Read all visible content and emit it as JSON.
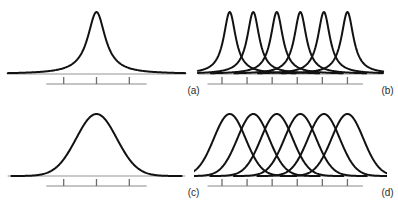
{
  "figure": {
    "background_color": "#ffffff",
    "curve_color": "#121212",
    "baseline_color": "#b9b9b9",
    "scalebar_color": "#b0b0b0",
    "tick_color": "#6d6d6d",
    "label_color": "#2b2b2b",
    "layout": "2x2 grid of line plots"
  },
  "chart_data": [
    {
      "type": "line",
      "panel": "a",
      "label": "(a)",
      "title": "",
      "xlabel": "",
      "ylabel": "",
      "description": "Single narrow Lorentzian peak on a flat baseline",
      "peak_shape": "lorentzian",
      "peak_count": 1,
      "peak_centers": [
        0.5
      ],
      "peak_heights": [
        1.0
      ],
      "peak_width": 0.055,
      "tick_count": 3,
      "tick_positions": [
        0.33,
        0.5,
        0.67
      ],
      "scalebar_range": [
        0.24,
        0.76
      ],
      "baseline_range": [
        0.04,
        0.96
      ],
      "xlim": [
        0,
        1
      ],
      "ylim": [
        0,
        1.1
      ],
      "grid": false,
      "legend": false
    },
    {
      "type": "line",
      "panel": "b",
      "label": "(b)",
      "title": "",
      "xlabel": "",
      "ylabel": "",
      "description": "Six narrow Lorentzian peaks, evenly spaced, resolved",
      "peak_shape": "lorentzian",
      "peak_count": 6,
      "peak_centers": [
        0.185,
        0.307,
        0.429,
        0.551,
        0.673,
        0.795
      ],
      "peak_heights": [
        1.0,
        1.0,
        1.0,
        1.0,
        1.0,
        1.0
      ],
      "peak_width": 0.038,
      "tick_count": 6,
      "tick_positions": [
        0.145,
        0.275,
        0.405,
        0.535,
        0.665,
        0.795
      ],
      "scalebar_range": [
        0.07,
        0.875
      ],
      "baseline_range": [
        0.02,
        0.98
      ],
      "xlim": [
        0,
        1
      ],
      "ylim": [
        0,
        1.1
      ],
      "grid": false,
      "legend": false
    },
    {
      "type": "line",
      "panel": "c",
      "label": "(c)",
      "title": "",
      "xlabel": "",
      "ylabel": "",
      "description": "Single broad Gaussian peak on a flat baseline",
      "peak_shape": "gaussian",
      "peak_count": 1,
      "peak_centers": [
        0.5
      ],
      "peak_heights": [
        1.0
      ],
      "peak_width": 0.105,
      "tick_count": 3,
      "tick_positions": [
        0.33,
        0.5,
        0.67
      ],
      "scalebar_range": [
        0.24,
        0.76
      ],
      "baseline_range": [
        0.04,
        0.96
      ],
      "xlim": [
        0,
        1
      ],
      "ylim": [
        0,
        1.1
      ],
      "grid": false,
      "legend": false
    },
    {
      "type": "line",
      "panel": "d",
      "label": "(d)",
      "title": "",
      "xlabel": "",
      "ylabel": "",
      "description": "Six broad Gaussian peaks, evenly spaced, strongly overlapping",
      "peak_shape": "gaussian",
      "peak_count": 6,
      "peak_centers": [
        0.185,
        0.307,
        0.429,
        0.551,
        0.673,
        0.795
      ],
      "peak_heights": [
        1.0,
        1.0,
        1.0,
        1.0,
        1.0,
        1.0
      ],
      "peak_width": 0.082,
      "tick_count": 6,
      "tick_positions": [
        0.145,
        0.275,
        0.405,
        0.535,
        0.665,
        0.795
      ],
      "scalebar_range": [
        0.07,
        0.875
      ],
      "baseline_range": [
        0.0,
        1.0
      ],
      "xlim": [
        0,
        1
      ],
      "ylim": [
        0,
        1.1
      ],
      "grid": false,
      "legend": false
    }
  ]
}
